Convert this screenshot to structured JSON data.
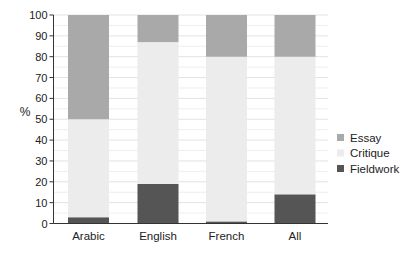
{
  "chart_data": {
    "type": "bar",
    "stacked": true,
    "title": "",
    "xlabel": "",
    "ylabel": "%",
    "ylim": [
      0,
      100
    ],
    "yticks": [
      0,
      10,
      20,
      30,
      40,
      50,
      60,
      70,
      80,
      90,
      100
    ],
    "grid": true,
    "legend_position": "right",
    "categories": [
      "Arabic",
      "English",
      "French",
      "All"
    ],
    "series": [
      {
        "name": "Fieldwork",
        "color": "#555555",
        "values": [
          3,
          19,
          1,
          14
        ]
      },
      {
        "name": "Critique",
        "color": "#ececec",
        "values": [
          47,
          68,
          79,
          66
        ]
      },
      {
        "name": "Essay",
        "color": "#a9a9a9",
        "values": [
          50,
          13,
          20,
          20
        ]
      }
    ],
    "legend": [
      "Essay",
      "Critique",
      "Fieldwork"
    ]
  }
}
